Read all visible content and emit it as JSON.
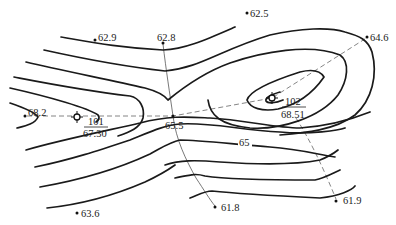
{
  "diagram": {
    "type": "topographic-contour-map",
    "contour_label": "65",
    "spot_heights": [
      {
        "label": "62.5",
        "x": 247,
        "y": 13
      },
      {
        "label": "62.9",
        "x": 96,
        "y": 39
      },
      {
        "label": "62.8",
        "x": 164,
        "y": 43
      },
      {
        "label": "64.6",
        "x": 368,
        "y": 37
      },
      {
        "label": "68.2",
        "x": 26,
        "y": 115
      },
      {
        "label": "65.5",
        "x": 173,
        "y": 116
      },
      {
        "label": "63.6",
        "x": 77,
        "y": 213
      },
      {
        "label": "61.8",
        "x": 215,
        "y": 207
      },
      {
        "label": "61.9",
        "x": 336,
        "y": 200
      }
    ],
    "stations": [
      {
        "number": "101",
        "elevation": "67.30",
        "x": 77,
        "y": 117
      },
      {
        "number": "102",
        "elevation": "68.51",
        "x": 272,
        "y": 98
      }
    ],
    "colors": {
      "contour": "#1a1a1a",
      "dashed_line": "#777777",
      "background": "#ffffff"
    }
  }
}
